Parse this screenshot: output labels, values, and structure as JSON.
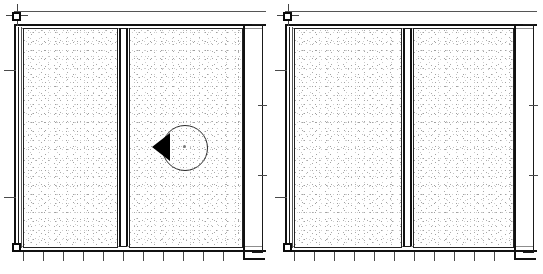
{
  "document": {
    "title": "Wall Panel Assembly - Plan Detail",
    "view_count": 2,
    "line_color": "#1a1a1a",
    "fill_color": "#ffffff",
    "stipple_color": "#b0b0b0",
    "marker_fill": "#000000"
  },
  "views": [
    {
      "id": "view-left",
      "label": "Left Panel Assembly",
      "has_section_marker": true,
      "panels": [
        {
          "id": "panel-l1",
          "label": "Left Wall Panel A",
          "hatch": "stipple-concrete"
        },
        {
          "id": "panel-l2",
          "label": "Left Wall Panel B",
          "hatch": "stipple-concrete"
        }
      ],
      "joint": {
        "id": "joint-left",
        "label": "Vertical Control Joint",
        "type": "double-line"
      },
      "nodes": [
        {
          "id": "node-l-tl",
          "label": "Top Left Column Node"
        },
        {
          "id": "node-l-bl",
          "label": "Bottom Left Column Node"
        }
      ],
      "bottom_ticks": 11,
      "left_ticks": 2,
      "right_ticks": 2,
      "section_marker": {
        "id": "section-marker-left",
        "label": "Section Detail Callout",
        "shape": "circle-with-triangle-pointer",
        "direction": "left"
      }
    },
    {
      "id": "view-right",
      "label": "Right Panel Assembly",
      "has_section_marker": false,
      "panels": [
        {
          "id": "panel-r1",
          "label": "Right Wall Panel A",
          "hatch": "stipple-concrete"
        },
        {
          "id": "panel-r2",
          "label": "Right Wall Panel B",
          "hatch": "stipple-concrete"
        }
      ],
      "joint": {
        "id": "joint-right",
        "label": "Vertical Control Joint",
        "type": "double-line"
      },
      "nodes": [
        {
          "id": "node-r-tl",
          "label": "Top Left Column Node"
        },
        {
          "id": "node-r-bl",
          "label": "Bottom Left Column Node"
        }
      ],
      "bottom_ticks": 11,
      "left_ticks": 2,
      "right_ticks": 2
    }
  ]
}
